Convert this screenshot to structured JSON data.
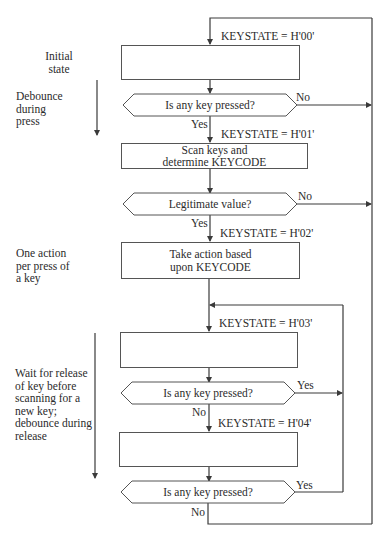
{
  "diagram": {
    "type": "flowchart"
  },
  "side_notes": [
    {
      "id": "initial",
      "text_lines": [
        "Initial",
        "state"
      ]
    },
    {
      "id": "debounce_press",
      "text_lines": [
        "Debounce",
        "during",
        "press"
      ]
    },
    {
      "id": "one_action",
      "text_lines": [
        "One action",
        "per press of",
        "a key"
      ]
    },
    {
      "id": "wait_release",
      "text_lines": [
        "Wait for release",
        "of key before",
        "scanning for a",
        "new key;",
        "debounce during",
        "release"
      ]
    }
  ],
  "states": [
    {
      "label": "KEYSTATE = H'00'"
    },
    {
      "label": "KEYSTATE = H'01'"
    },
    {
      "label": "KEYSTATE = H'02'"
    },
    {
      "label": "KEYSTATE = H'03'"
    },
    {
      "label": "KEYSTATE = H'04'"
    }
  ],
  "process_boxes": [
    {
      "state": "H'00'",
      "text_lines": []
    },
    {
      "state": "H'01'",
      "text_lines": [
        "Scan keys and",
        "determine KEYCODE"
      ]
    },
    {
      "state": "H'02'",
      "text_lines": [
        "Take action based",
        "upon KEYCODE"
      ]
    },
    {
      "state": "H'03'",
      "text_lines": []
    },
    {
      "state": "H'04'",
      "text_lines": []
    }
  ],
  "decisions": [
    {
      "question": "Is any key pressed?",
      "down_label": "Yes",
      "right_label": "No"
    },
    {
      "question": "Legitimate value?",
      "down_label": "Yes",
      "right_label": "No"
    },
    {
      "question": "Is any key pressed?",
      "down_label": "No",
      "right_label": "Yes"
    },
    {
      "question": "Is any key pressed?",
      "down_label": "No",
      "right_label": "Yes"
    }
  ],
  "colors": {
    "line": "#3a3a3a",
    "box_border": "#555555",
    "text": "#2b2b2b",
    "background": "#ffffff"
  }
}
